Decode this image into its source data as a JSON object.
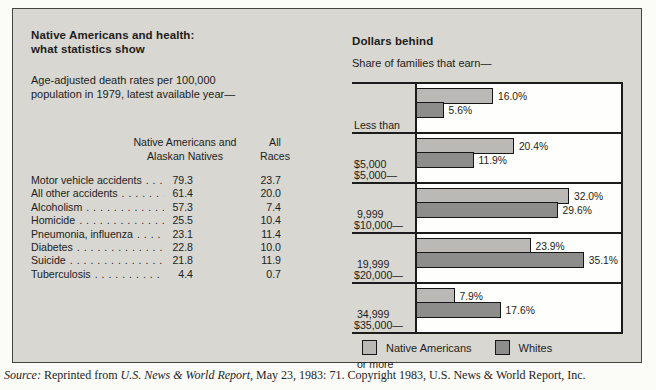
{
  "figure": {
    "left_panel": {
      "title_line1": "Native Americans and health:",
      "title_line2": "what statistics show",
      "subtitle_line1": "Age-adjusted death rates per 100,000",
      "subtitle_line2": "population in 1979, latest available year—",
      "table": {
        "col1_header_line1": "Native Americans and",
        "col1_header_line2": "Alaskan Natives",
        "col2_header_line1": "All",
        "col2_header_line2": "Races",
        "rows": [
          {
            "label": "Motor vehicle accidents",
            "native": "79.3",
            "all": "23.7"
          },
          {
            "label": "All other accidents",
            "native": "61.4",
            "all": "20.0"
          },
          {
            "label": "Alcoholism",
            "native": "57.3",
            "all": "7.4"
          },
          {
            "label": "Homicide",
            "native": "25.5",
            "all": "10.4"
          },
          {
            "label": "Pneumonia, influenza",
            "native": "23.1",
            "all": "11.4"
          },
          {
            "label": "Diabetes",
            "native": "22.8",
            "all": "10.0"
          },
          {
            "label": "Suicide",
            "native": "21.8",
            "all": "11.9"
          },
          {
            "label": "Tuberculosis",
            "native": "4.4",
            "all": "0.7"
          }
        ]
      }
    },
    "right_panel": {
      "title": "Dollars behind",
      "subtitle": "Share of families that earn—",
      "legend": [
        {
          "label": "Native Americans",
          "color": "#bab9b5"
        },
        {
          "label": "Whites",
          "color": "#8d8d8b"
        }
      ]
    },
    "source": {
      "label": "Source:",
      "pre": " Reprinted from ",
      "journal": "U.S. News & World Report",
      "post": ", May 23, 1983: 71. Copyright 1983, U.S. News & World Report, Inc."
    }
  },
  "palette": {
    "page_bg": "#fbfbf7",
    "figure_bg": "#d8d7d2",
    "plot_bg": "#fefefc",
    "bar_light": "#bab9b5",
    "bar_dark": "#8d8d8b",
    "line": "#1c1c1c",
    "text": "#1d1d1b"
  },
  "chart_data": [
    {
      "type": "table",
      "title": "Native Americans and health: what statistics show",
      "subtitle": "Age-adjusted death rates per 100,000 population in 1979, latest available year—",
      "columns": [
        "Cause of death",
        "Native Americans and Alaskan Natives",
        "All Races"
      ],
      "rows": [
        [
          "Motor vehicle accidents",
          79.3,
          23.7
        ],
        [
          "All other accidents",
          61.4,
          20.0
        ],
        [
          "Alcoholism",
          57.3,
          7.4
        ],
        [
          "Homicide",
          25.5,
          10.4
        ],
        [
          "Pneumonia, influenza",
          23.1,
          11.4
        ],
        [
          "Diabetes",
          22.8,
          10.0
        ],
        [
          "Suicide",
          21.8,
          11.9
        ],
        [
          "Tuberculosis",
          4.4,
          0.7
        ]
      ]
    },
    {
      "type": "bar",
      "orientation": "horizontal",
      "title": "Dollars behind",
      "subtitle": "Share of families that earn—",
      "categories": [
        "Less than $5,000",
        "$5,000—9,999",
        "$10,000—19,999",
        "$20,000—34,999",
        "$35,000 or more"
      ],
      "categories_display": [
        {
          "line1": "Less than",
          "line2": "$5,000"
        },
        {
          "line1": "$5,000—",
          "line2": " 9,999"
        },
        {
          "line1": "$10,000—",
          "line2": " 19,999"
        },
        {
          "line1": "$20,000—",
          "line2": " 34,999"
        },
        {
          "line1": "$35,000—",
          "line2": " or more"
        }
      ],
      "series": [
        {
          "name": "Native Americans",
          "color": "#bab9b5",
          "values": [
            16.0,
            20.4,
            32.0,
            23.9,
            7.9
          ]
        },
        {
          "name": "Whites",
          "color": "#8d8d8b",
          "values": [
            5.6,
            11.9,
            29.6,
            35.1,
            17.6
          ]
        }
      ],
      "value_suffix": "%",
      "xlim": [
        0,
        42
      ],
      "grid": false,
      "legend_position": "bottom"
    }
  ]
}
